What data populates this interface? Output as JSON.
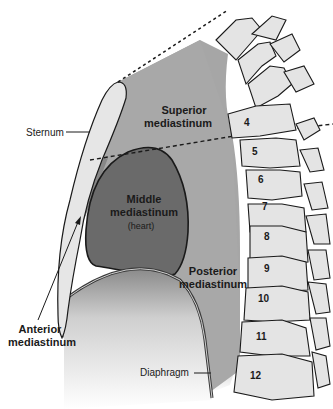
{
  "diagram": {
    "type": "anatomical-sagittal-section",
    "regions": {
      "superior": {
        "line1": "Superior",
        "line2": "mediastinum"
      },
      "middle": {
        "line1": "Middle",
        "line2": "mediastinum",
        "note": "(heart)"
      },
      "posterior": {
        "line1": "Posterior",
        "line2": "mediastinum"
      },
      "anterior": {
        "line1": "Anterior",
        "line2": "mediastinum"
      }
    },
    "callouts": {
      "sternum": "Sternum",
      "diaphragm": "Diaphragm"
    },
    "vertebrae": [
      "4",
      "5",
      "6",
      "7",
      "8",
      "9",
      "10",
      "11",
      "12"
    ],
    "colors": {
      "superior_fill": "#a9a9a9",
      "middle_fill": "#6a6a6a",
      "anterior_fill": "#8c8c8c",
      "posterior_fill": "#a3a3a3",
      "bone_fill": "#e4e4e4",
      "outline": "#1a1a1a"
    }
  }
}
